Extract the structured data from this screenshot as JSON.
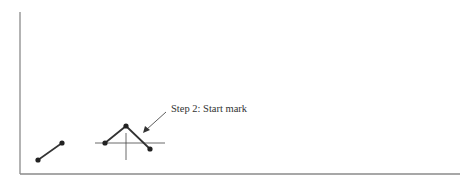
{
  "figure": {
    "step_label": "Step 2: Start mark",
    "colors": {
      "frame": "#8a8a8a",
      "ink": "#333333",
      "background": "#ffffff"
    },
    "frame": {
      "left_x": 20,
      "top_y": 12,
      "bottom_y": 174,
      "right_x": 460
    },
    "segment_1": {
      "points": [
        [
          38,
          160
        ],
        [
          62,
          143
        ]
      ]
    },
    "crosshair": {
      "center": [
        126,
        143
      ],
      "h_from": 95,
      "h_to": 165,
      "v_from": 133,
      "v_to": 160
    },
    "polyline": {
      "points": [
        [
          105,
          143
        ],
        [
          126,
          126
        ],
        [
          150,
          149
        ]
      ]
    },
    "arrow": {
      "from": [
        166,
        112
      ],
      "to": [
        144,
        132
      ]
    }
  }
}
